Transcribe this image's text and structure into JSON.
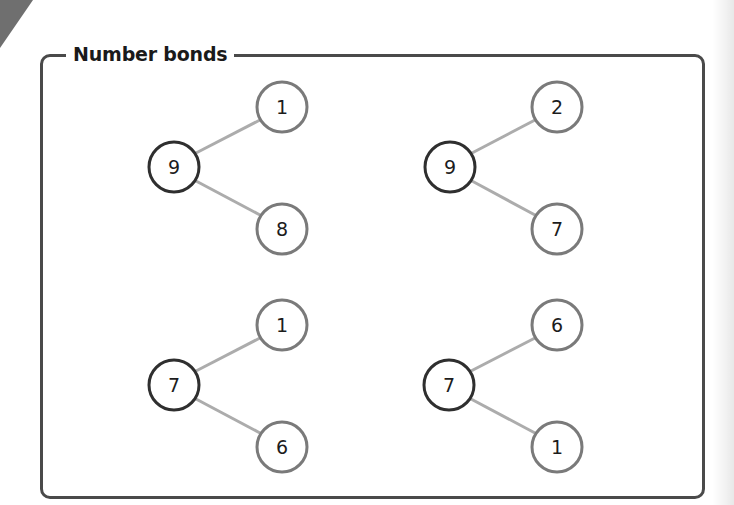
{
  "page": {
    "section_title": "Number bonds"
  },
  "colors": {
    "frame": "#4a4a4a",
    "whole_circle": "#2f2f2f",
    "part_circle": "#7a7a7a",
    "connector": "#acacac",
    "corner_tab": "#6f6f6f"
  },
  "bonds": [
    {
      "whole": "9",
      "top_part": "1",
      "bottom_part": "8"
    },
    {
      "whole": "9",
      "top_part": "2",
      "bottom_part": "7"
    },
    {
      "whole": "7",
      "top_part": "1",
      "bottom_part": "6"
    },
    {
      "whole": "7",
      "top_part": "6",
      "bottom_part": "1"
    }
  ]
}
